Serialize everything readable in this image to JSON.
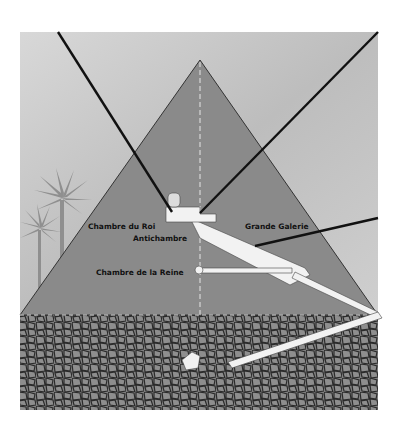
{
  "diagram": {
    "labels": {
      "kings_chamber": "Chambre du Roi",
      "antechamber": "Antichambre",
      "grand_gallery": "Grande Galerie",
      "queens_chamber": "Chambre de la Reine"
    },
    "colors": {
      "sky": "#c9c9c9",
      "pyramid": "#8a8a8a",
      "bedrock": "#7a7a7a",
      "passages": "#f2f2f2",
      "lines": "#111111"
    }
  }
}
